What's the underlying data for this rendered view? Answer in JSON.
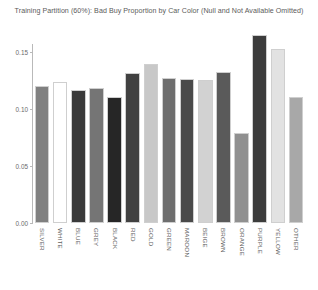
{
  "chart_data": {
    "type": "bar",
    "title": "Training Partition (60%): Bad Buy Proportion by Car Color (Null and Not Available Omitted)",
    "xlabel": "",
    "ylabel": "",
    "ylim": [
      0.0,
      0.17
    ],
    "yticks": [
      "0.00",
      "0.05",
      "0.10",
      "0.15"
    ],
    "ytick_values": [
      0.0,
      0.05,
      0.1,
      0.15
    ],
    "grid": false,
    "legend": false,
    "categories": [
      "SILVER",
      "WHITE",
      "BLUE",
      "GREY",
      "BLACK",
      "RED",
      "GOLD",
      "GREEN",
      "MAROON",
      "BEIGE",
      "BROWN",
      "ORANGE",
      "PURPLE",
      "YELLOW",
      "OTHER"
    ],
    "values": [
      0.121,
      0.124,
      0.117,
      0.119,
      0.111,
      0.132,
      0.14,
      0.128,
      0.127,
      0.126,
      0.133,
      0.079,
      0.166,
      0.153,
      0.111
    ],
    "bar_colors": [
      "#808080",
      "#ffffff",
      "#3a3a3a",
      "#757575",
      "#262626",
      "#414141",
      "#c8c8c8",
      "#6e6e6e",
      "#4a4a4a",
      "#d2d2d2",
      "#5a5a5a",
      "#909090",
      "#3c3c3c",
      "#e2e2e2",
      "#a8a8a8"
    ],
    "bar_edge_color": "#cfcfcf",
    "axis_color": "#b9b9b9",
    "text_color": "#5b5b5b",
    "background": "#ffffff"
  }
}
